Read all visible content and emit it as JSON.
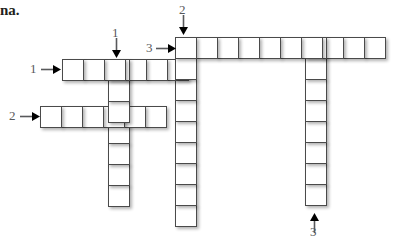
{
  "page": {
    "heading_fragment": "na.",
    "background_color": "#ffffff",
    "cell_border_color": "#4a4a4a",
    "label_color": "#58595b"
  },
  "puzzle": {
    "type": "crossword-grid",
    "cell_size_px": 22,
    "entries": [
      {
        "id": "across-1",
        "number": "1",
        "direction": "across",
        "length": 6,
        "start_x": 62,
        "start_y": 59
      },
      {
        "id": "across-2",
        "number": "2",
        "direction": "across",
        "length": 6,
        "start_x": 40,
        "start_y": 106
      },
      {
        "id": "across-3",
        "number": "3",
        "direction": "across",
        "length": 10,
        "start_x": 175,
        "start_y": 37
      },
      {
        "id": "down-1",
        "number": "1",
        "direction": "down",
        "length": 7,
        "start_x": 108,
        "start_y": 59
      },
      {
        "id": "down-2",
        "number": "2",
        "direction": "down",
        "length": 9,
        "start_x": 175,
        "start_y": 37
      },
      {
        "id": "down-3",
        "number": "3",
        "direction": "down",
        "length": 8,
        "start_x": 305,
        "start_y": 37
      }
    ],
    "labels": [
      {
        "id": "label-down-1",
        "text": "1",
        "x": 112,
        "y": 26
      },
      {
        "id": "label-down-2",
        "text": "2",
        "x": 179,
        "y": 3
      },
      {
        "id": "label-across-3",
        "text": "3",
        "x": 146,
        "y": 41
      },
      {
        "id": "label-across-1",
        "text": "1",
        "x": 30,
        "y": 62
      },
      {
        "id": "label-across-2",
        "text": "2",
        "x": 9,
        "y": 109
      },
      {
        "id": "label-down-3",
        "text": "3",
        "x": 310,
        "y": 225
      }
    ],
    "arrows": [
      {
        "id": "arrow-down-1",
        "points": "down",
        "x": 112,
        "y": 38
      },
      {
        "id": "arrow-down-2",
        "points": "down",
        "x": 179,
        "y": 15
      },
      {
        "id": "arrow-across-3",
        "points": "right",
        "x": 156,
        "y": 44
      },
      {
        "id": "arrow-across-1",
        "points": "right",
        "x": 41,
        "y": 65
      },
      {
        "id": "arrow-across-2",
        "points": "right",
        "x": 20,
        "y": 112
      },
      {
        "id": "arrow-down-3",
        "points": "up",
        "x": 310,
        "y": 213
      }
    ]
  }
}
